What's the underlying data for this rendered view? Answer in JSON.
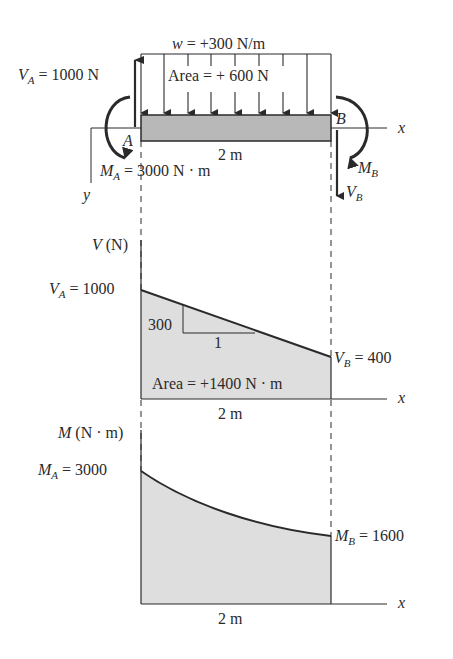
{
  "free_body": {
    "load_label_sym": "w",
    "load_label_val": " = +300 N/m",
    "area_load": "Area = + 600 N",
    "va_sym": "V",
    "va_sub": "A",
    "va_val": " = 1000 N",
    "ma_sym": "M",
    "ma_sub": "A",
    "ma_val": " = 3000 N · m",
    "point_a": "A",
    "point_b": "B",
    "mb_sym": "M",
    "mb_sub": "B",
    "vb_sym": "V",
    "vb_sub": "B",
    "length": "2 m",
    "x_axis": "x",
    "y_axis": "y"
  },
  "shear": {
    "axis_sym": "V",
    "axis_unit": " (N)",
    "va_sym": "V",
    "va_sub": "A",
    "va_val": " = 1000",
    "vb_sym": "V",
    "vb_sub": "B",
    "vb_val": " = 400",
    "slope_rise": "300",
    "slope_run": "1",
    "area": "Area = +1400 N · m",
    "length": "2 m",
    "x_axis": "x"
  },
  "moment": {
    "axis_sym": "M",
    "axis_unit": " (N · m)",
    "ma_sym": "M",
    "ma_sub": "A",
    "ma_val": " = 3000",
    "mb_sym": "M",
    "mb_sub": "B",
    "mb_val": " = 1600",
    "length": "2 m",
    "x_axis": "x"
  },
  "colors": {
    "ink": "#2a2a2a",
    "fill": "#dedede",
    "beam_fill": "#b8b8b8"
  }
}
